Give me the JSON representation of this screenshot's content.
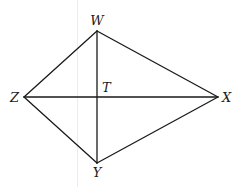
{
  "diagram": {
    "type": "kite-quadrilateral",
    "vertices": [
      {
        "id": "W",
        "label": "W",
        "x": 97,
        "y": 31,
        "label_x": 97,
        "label_y": 25,
        "anchor": "middle"
      },
      {
        "id": "X",
        "label": "X",
        "x": 218,
        "y": 97,
        "label_x": 222,
        "label_y": 102,
        "anchor": "start"
      },
      {
        "id": "Y",
        "label": "Y",
        "x": 97,
        "y": 163,
        "label_x": 97,
        "label_y": 176,
        "anchor": "middle"
      },
      {
        "id": "Z",
        "label": "Z",
        "x": 24,
        "y": 97,
        "label_x": 19,
        "label_y": 102,
        "anchor": "end"
      }
    ],
    "intersection": {
      "id": "T",
      "label": "T",
      "x": 97,
      "y": 97,
      "label_x": 102,
      "label_y": 92,
      "anchor": "start"
    },
    "sides": [
      [
        "W",
        "X"
      ],
      [
        "X",
        "Y"
      ],
      [
        "Y",
        "Z"
      ],
      [
        "Z",
        "W"
      ]
    ],
    "diagonals": [
      [
        "W",
        "Y"
      ],
      [
        "Z",
        "X"
      ]
    ],
    "stroke_color": "#1a1a1a",
    "background": "#ffffff"
  },
  "labels": {
    "W": "W",
    "X": "X",
    "Y": "Y",
    "Z": "Z",
    "T": "T"
  }
}
